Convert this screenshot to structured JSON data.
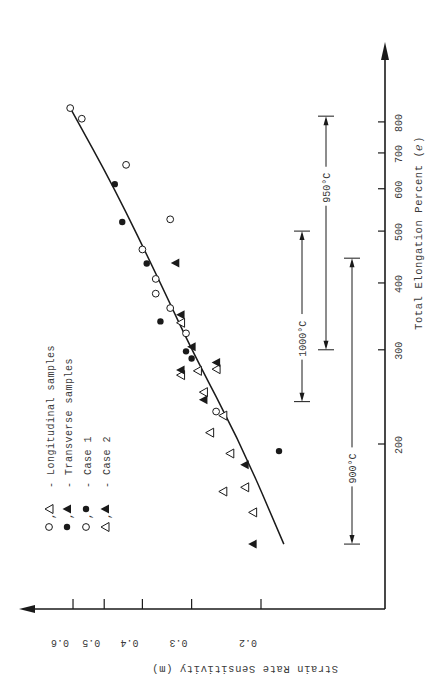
{
  "chart_data": {
    "type": "scatter",
    "orientation": "rotated-90-clockwise",
    "title": "",
    "xlabel": "Total Elongation Percent (ℯ)",
    "ylabel": "Strain Rate Sensitivity (m)",
    "x_scale": "log",
    "y_scale": "log",
    "xlim": [
      120,
      900
    ],
    "ylim": [
      0.14,
      0.65
    ],
    "x_ticks": [
      200,
      300,
      400,
      500,
      600,
      700,
      800
    ],
    "x_tick_labels": [
      "200",
      "300",
      "400",
      "500",
      "600",
      "700",
      "800"
    ],
    "y_ticks": [
      0.2,
      0.3,
      0.4,
      0.5,
      0.6
    ],
    "y_tick_labels": [
      "0.2",
      "0.3",
      "0.4",
      "0.5",
      "0.6"
    ],
    "grid": false,
    "legend_position": "upper-left (rotated)",
    "legend": [
      {
        "symbols": "o, Δ",
        "label": "- Longitudinal samples"
      },
      {
        "symbols": "●, ▲",
        "label": "- Transverse samples"
      },
      {
        "symbols": "o, ●",
        "label": "- Case 1"
      },
      {
        "symbols": "Δ, ▲",
        "label": "- Case 2"
      }
    ],
    "series": [
      {
        "name": "Longitudinal, Case 1",
        "marker": "open-circle",
        "points": [
          [
            849,
            0.61
          ],
          [
            811,
            0.57
          ],
          [
            665,
            0.44
          ],
          [
            462,
            0.4
          ],
          [
            407,
            0.37
          ],
          [
            382,
            0.37
          ],
          [
            359,
            0.34
          ],
          [
            322,
            0.31
          ],
          [
            230,
            0.26
          ],
          [
            526,
            0.34
          ]
        ]
      },
      {
        "name": "Transverse, Case 1",
        "marker": "filled-circle",
        "points": [
          [
            612,
            0.47
          ],
          [
            435,
            0.39
          ],
          [
            339,
            0.36
          ],
          [
            289,
            0.3
          ],
          [
            298,
            0.31
          ],
          [
            194,
            0.18
          ],
          [
            520,
            0.45
          ]
        ]
      },
      {
        "name": "Longitudinal, Case 2",
        "marker": "open-triangle",
        "points": [
          [
            337,
            0.32
          ],
          [
            274,
            0.29
          ],
          [
            276,
            0.26
          ],
          [
            269,
            0.32
          ],
          [
            250,
            0.28
          ],
          [
            226,
            0.25
          ],
          [
            210,
            0.27
          ],
          [
            192,
            0.24
          ],
          [
            166,
            0.22
          ],
          [
            163,
            0.25
          ],
          [
            149,
            0.21
          ]
        ]
      },
      {
        "name": "Transverse, Case 2",
        "marker": "filled-triangle",
        "points": [
          [
            436,
            0.33
          ],
          [
            349,
            0.32
          ],
          [
            304,
            0.3
          ],
          [
            275,
            0.32
          ],
          [
            284,
            0.26
          ],
          [
            242,
            0.28
          ],
          [
            183,
            0.22
          ],
          [
            130,
            0.21
          ]
        ]
      }
    ],
    "fit_curve": {
      "name": "trend",
      "points": [
        [
          850,
          0.61
        ],
        [
          600,
          0.47
        ],
        [
          400,
          0.36
        ],
        [
          300,
          0.3
        ],
        [
          200,
          0.225
        ],
        [
          130,
          0.175
        ]
      ]
    },
    "annotations": [
      {
        "label": "900°C",
        "range": [
          130,
          445
        ]
      },
      {
        "label": "950°C",
        "range": [
          300,
          820
        ]
      },
      {
        "label": "1000°C",
        "range": [
          240,
          500
        ]
      }
    ]
  },
  "labels": {
    "x_axis_title": "Total Elongation Percent (ℯ)",
    "y_axis_title": "Strain Rate Sensitivity (m)"
  }
}
